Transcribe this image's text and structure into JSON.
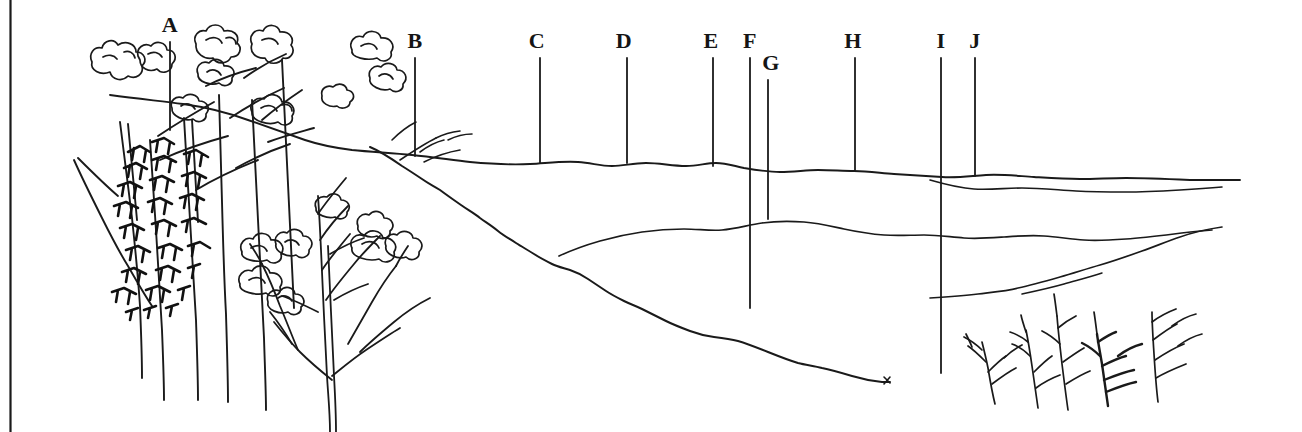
{
  "figure": {
    "kind": "landscape-profile-line-drawing",
    "width": 1302,
    "height": 432,
    "background_color": "#ffffff",
    "ink_color": "#1a1a1a",
    "border": {
      "left_rule_visible": true,
      "left_rule_x": 10,
      "right_rule_visible": false,
      "top_rule_visible": false,
      "bottom_rule_visible": false
    }
  },
  "labels": [
    {
      "id": "A",
      "text": "A",
      "label_x": 170,
      "label_y": 36,
      "line_x": 170,
      "line_top": 42,
      "line_bottom": 130
    },
    {
      "id": "B",
      "text": "B",
      "label_x": 415,
      "label_y": 52,
      "line_x": 415,
      "line_top": 58,
      "line_bottom": 156
    },
    {
      "id": "C",
      "text": "C",
      "label_x": 537,
      "label_y": 52,
      "line_x": 540,
      "line_top": 58,
      "line_bottom": 163
    },
    {
      "id": "D",
      "text": "D",
      "label_x": 624,
      "label_y": 52,
      "line_x": 627,
      "line_top": 58,
      "line_bottom": 163
    },
    {
      "id": "E",
      "text": "E",
      "label_x": 711,
      "label_y": 52,
      "line_x": 713,
      "line_top": 58,
      "line_bottom": 166
    },
    {
      "id": "F",
      "text": "F",
      "label_x": 750,
      "label_y": 52,
      "line_x": 750,
      "line_top": 58,
      "line_bottom": 308
    },
    {
      "id": "G",
      "text": "G",
      "label_x": 771,
      "label_y": 74,
      "line_x": 768,
      "line_top": 80,
      "line_bottom": 219
    },
    {
      "id": "H",
      "text": "H",
      "label_x": 853,
      "label_y": 52,
      "line_x": 855,
      "line_top": 58,
      "line_bottom": 170
    },
    {
      "id": "I",
      "text": "I",
      "label_x": 941,
      "label_y": 52,
      "line_x": 941,
      "line_top": 58,
      "line_bottom": 373
    },
    {
      "id": "J",
      "text": "J",
      "label_x": 975,
      "label_y": 52,
      "line_x": 975,
      "line_top": 58,
      "line_bottom": 176
    }
  ],
  "terrain": {
    "horizon_ridge": "Main far horizon ridge running from behind the left trees across to the right edge",
    "descending_slope": "Long ragged slope descending from the left trees down to the right-centre",
    "mid_ridge": "Mid-ground ridge rising from the descending slope toward the right",
    "right_lower_slope": "Low slope rising from the left toward the right behind the small shrubs"
  },
  "vegetation": {
    "left_grove_description": "Tall sparse trees with cloud-like foliage clusters and one dense dark leafy mass",
    "right_shrubs_description": "Five small bare twiggy shrubs in the lower right foreground",
    "right_shrub_count": 5
  }
}
